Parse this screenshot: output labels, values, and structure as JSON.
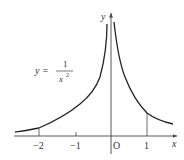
{
  "figure": {
    "function_label": {
      "lhs": "y =",
      "numerator": "1",
      "denominator": "x",
      "exponent": "2"
    },
    "axes": {
      "x_label": "x",
      "y_label": "y",
      "origin_label": "O"
    },
    "x_ticks": [
      {
        "label": "−2",
        "value": -2
      },
      {
        "label": "−1",
        "value": -1
      },
      {
        "label": "1",
        "value": 1
      }
    ],
    "colors": {
      "curve": "#222222",
      "axis": "#444444",
      "text": "#333333"
    }
  }
}
